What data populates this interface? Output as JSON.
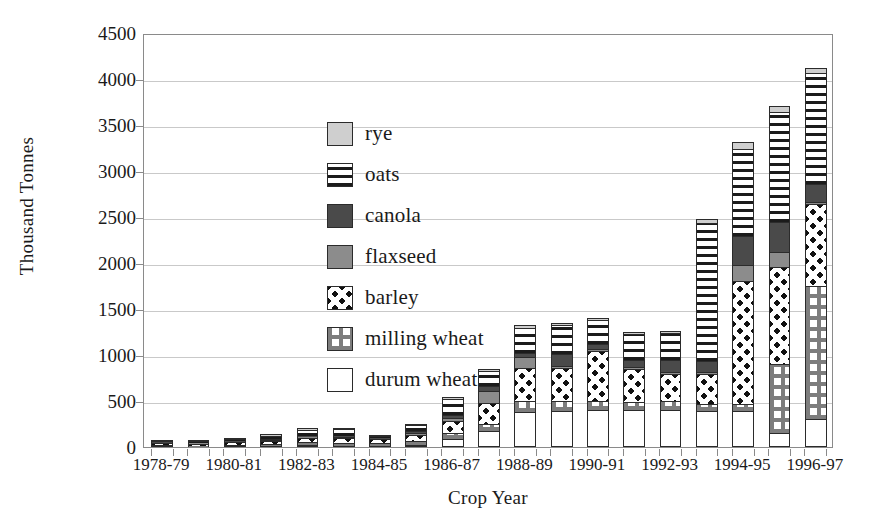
{
  "chart_data": {
    "type": "bar",
    "subtype": "stacked-bar",
    "title": "",
    "xlabel": "Crop Year",
    "ylabel": "Thousand Tonnes",
    "ylim": [
      0,
      4500
    ],
    "ytick_step": 500,
    "yticks": [
      "0",
      "500",
      "1000",
      "1500",
      "2000",
      "2500",
      "3000",
      "3500",
      "4000",
      "4500"
    ],
    "grid": "horizontal",
    "legend_position": "inside-upper-left",
    "categories": [
      "1978-79",
      "1979-80",
      "1980-81",
      "1981-82",
      "1982-83",
      "1983-84",
      "1984-85",
      "1985-86",
      "1986-87",
      "1987-88",
      "1988-89",
      "1989-90",
      "1990-91",
      "1991-92",
      "1992-93",
      "1993-94",
      "1994-95",
      "1995-96",
      "1996-97"
    ],
    "visible_tick_labels": [
      "1978-79",
      "1980-81",
      "1982-83",
      "1984-85",
      "1986-87",
      "1988-89",
      "1990-91",
      "1992-93",
      "1994-95",
      "1996-97"
    ],
    "series": [
      {
        "name": "durum wheat",
        "key": "durum",
        "pattern": "plain-white",
        "color": "#ffffff",
        "values": [
          10,
          5,
          10,
          15,
          20,
          15,
          15,
          25,
          90,
          175,
          385,
          395,
          405,
          400,
          400,
          395,
          390,
          150,
          300
        ]
      },
      {
        "name": "milling wheat",
        "key": "milling",
        "pattern": "grey-plaid",
        "color": "#7d7d7d",
        "values": [
          15,
          10,
          15,
          20,
          35,
          30,
          25,
          40,
          60,
          70,
          115,
          100,
          100,
          85,
          105,
          70,
          80,
          750,
          1450
        ]
      },
      {
        "name": "barley",
        "key": "barley",
        "pattern": "black-dots",
        "color": "#111111",
        "values": [
          15,
          20,
          25,
          30,
          45,
          50,
          45,
          70,
          130,
          230,
          360,
          360,
          540,
          360,
          290,
          330,
          1330,
          1060,
          890
        ]
      },
      {
        "name": "flaxseed",
        "key": "flaxseed",
        "pattern": "solid-medium-grey",
        "color": "#8c8c8c",
        "values": [
          5,
          5,
          5,
          10,
          10,
          15,
          5,
          20,
          35,
          130,
          115,
          30,
          25,
          30,
          25,
          15,
          175,
          160,
          20
        ]
      },
      {
        "name": "canola",
        "key": "canola",
        "pattern": "solid-dark-grey",
        "color": "#4a4a4a",
        "values": [
          5,
          5,
          5,
          10,
          15,
          15,
          5,
          20,
          30,
          60,
          45,
          125,
          55,
          70,
          130,
          120,
          320,
          325,
          195
        ]
      },
      {
        "name": "oats",
        "key": "oats",
        "pattern": "horizontal-stripes",
        "color": "#1b1b1b",
        "values": [
          15,
          15,
          25,
          35,
          60,
          70,
          20,
          60,
          180,
          160,
          275,
          320,
          255,
          285,
          285,
          1500,
          945,
          1200,
          1210
        ]
      },
      {
        "name": "rye",
        "key": "rye",
        "pattern": "solid-light-grey",
        "color": "#cfcfcf",
        "values": [
          5,
          5,
          5,
          5,
          10,
          10,
          5,
          10,
          15,
          25,
          30,
          20,
          25,
          25,
          25,
          45,
          70,
          60,
          50
        ]
      }
    ],
    "totals": [
      70,
      65,
      90,
      125,
      195,
      205,
      120,
      245,
      540,
      850,
      1325,
      1350,
      1405,
      1255,
      1260,
      2475,
      3310,
      3705,
      4115
    ]
  },
  "legend": {
    "entries": [
      {
        "label": "rye",
        "key": "rye"
      },
      {
        "label": "oats",
        "key": "oats"
      },
      {
        "label": "canola",
        "key": "canola"
      },
      {
        "label": "flaxseed",
        "key": "flaxseed"
      },
      {
        "label": "barley",
        "key": "barley"
      },
      {
        "label": "milling wheat",
        "key": "milling"
      },
      {
        "label": "durum wheat",
        "key": "durum"
      }
    ]
  },
  "axes": {
    "y_title": "Thousand Tonnes",
    "x_title": "Crop Year"
  }
}
